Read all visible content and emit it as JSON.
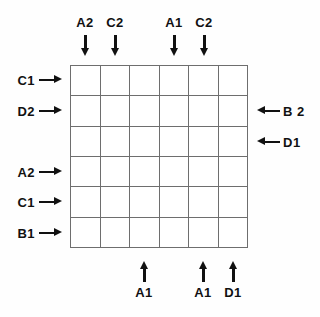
{
  "figure": {
    "type": "annotated-grid-diagram",
    "grid": {
      "rows": 6,
      "columns": 6,
      "line_color": "#6e6e6e",
      "cell_fill": "#ffffff"
    },
    "background_color": "#fefefe",
    "text_color": "#111111"
  },
  "top_markers": [
    {
      "label": "A2",
      "column": 1,
      "direction": "down"
    },
    {
      "label": "C2",
      "column": 2,
      "direction": "down"
    },
    {
      "label": "A1",
      "column": 4,
      "direction": "down"
    },
    {
      "label": "C2",
      "column": 5,
      "direction": "down"
    }
  ],
  "left_markers": [
    {
      "label": "C1",
      "row": 1,
      "direction": "right"
    },
    {
      "label": "D2",
      "row": 2,
      "direction": "right"
    },
    {
      "label": "A2",
      "row": 4,
      "direction": "right"
    },
    {
      "label": "C1",
      "row": 5,
      "direction": "right"
    },
    {
      "label": "B1",
      "row": 6,
      "direction": "right"
    }
  ],
  "right_markers": [
    {
      "label": "B 2",
      "row": 2,
      "direction": "left"
    },
    {
      "label": "D1",
      "row": 3,
      "direction": "left"
    }
  ],
  "bottom_markers": [
    {
      "label": "A1",
      "column": 3,
      "direction": "up"
    },
    {
      "label": "A1",
      "column": 5,
      "direction": "up"
    },
    {
      "label": "D1",
      "column": 6,
      "direction": "up"
    }
  ]
}
